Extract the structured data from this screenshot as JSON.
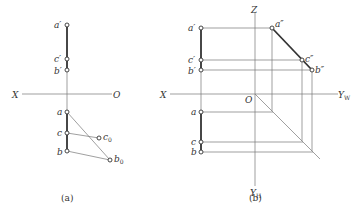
{
  "figure_a": {
    "caption": "(a)",
    "axis_labels": {
      "x": "X",
      "o": "O"
    },
    "points": {
      "a_prime": "a′",
      "c_prime": "c′",
      "b_prime": "b′",
      "a": "a",
      "c": "c",
      "b": "b",
      "c0": "c",
      "c0_sub": "0",
      "b0": "b",
      "b0_sub": "0"
    }
  },
  "figure_b": {
    "caption": "(b)",
    "axis_labels": {
      "x": "X",
      "z": "Z",
      "o": "O",
      "yw": "Y",
      "yw_sub": "W",
      "yh": "Y",
      "yh_sub": "H"
    },
    "points": {
      "a_prime": "a′",
      "c_prime": "c′",
      "b_prime": "b′",
      "a_dprime": "a″",
      "c_dprime": "c″",
      "b_dprime": "b″",
      "a": "a",
      "c": "c",
      "b": "b"
    }
  }
}
